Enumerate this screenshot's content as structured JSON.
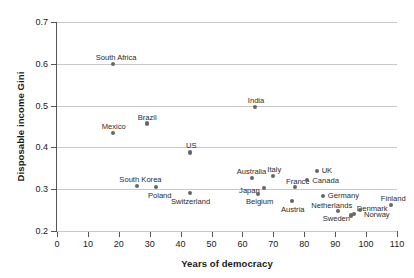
{
  "chart_data": {
    "type": "scatter",
    "title": "",
    "xlabel": "Years of democracy",
    "ylabel": "Disposable income Gini",
    "xlim": [
      0,
      110
    ],
    "ylim": [
      0.2,
      0.7
    ],
    "xticks": [
      0,
      10,
      20,
      30,
      40,
      50,
      60,
      70,
      80,
      90,
      100,
      110
    ],
    "yticks": [
      "0.2",
      "0.3",
      "0.4",
      "0.5",
      "0.6",
      "0.7"
    ],
    "grid": "horizontal",
    "legend": "none",
    "marker_color": "#666666",
    "gridline_color": "#c8c8c8",
    "axis_color": "#555555",
    "points": [
      {
        "label": "South Africa",
        "x": 18,
        "y": 0.6,
        "lx": -17,
        "ly": -11
      },
      {
        "label": "Mexico",
        "x": 18,
        "y": 0.435,
        "lx": -11,
        "ly": -11
      },
      {
        "label": "Brazil",
        "x": 29,
        "y": 0.457,
        "lx": -9,
        "ly": -11
      },
      {
        "label": "US",
        "x": 43,
        "y": 0.388,
        "lx": -4,
        "ly": -11
      },
      {
        "label": "South Korea",
        "x": 26,
        "y": 0.308,
        "lx": -18,
        "ly": -11
      },
      {
        "label": "Poland",
        "x": 32,
        "y": 0.305,
        "lx": -8,
        "ly": 4
      },
      {
        "label": "Switzerland",
        "x": 43,
        "y": 0.29,
        "lx": -19,
        "ly": 4
      },
      {
        "label": "India",
        "x": 64,
        "y": 0.497,
        "lx": -7,
        "ly": -11
      },
      {
        "label": "Australia",
        "x": 63,
        "y": 0.327,
        "lx": -15,
        "ly": -11
      },
      {
        "label": "Italy",
        "x": 70,
        "y": 0.332,
        "lx": -6,
        "ly": -11
      },
      {
        "label": "France",
        "x": 77,
        "y": 0.305,
        "lx": -9,
        "ly": -10
      },
      {
        "label": "Japan",
        "x": 67,
        "y": 0.303,
        "lx": -25,
        "ly": -2
      },
      {
        "label": "Belgium",
        "x": 65,
        "y": 0.288,
        "lx": -12,
        "ly": 3
      },
      {
        "label": "Austria",
        "x": 76,
        "y": 0.272,
        "lx": -11,
        "ly": 4
      },
      {
        "label": "Germany",
        "x": 86,
        "y": 0.283,
        "lx": 5,
        "ly": -5
      },
      {
        "label": "UK",
        "x": 84,
        "y": 0.344,
        "lx": 5,
        "ly": -5
      },
      {
        "label": "Canada",
        "x": 81,
        "y": 0.322,
        "lx": 5,
        "ly": -4
      },
      {
        "label": "Netherlands",
        "x": 91,
        "y": 0.248,
        "lx": -27,
        "ly": -10
      },
      {
        "label": "Sweden",
        "x": 95,
        "y": 0.237,
        "lx": -28,
        "ly": -2
      },
      {
        "label": "Denmark",
        "x": 96,
        "y": 0.24,
        "lx": 3,
        "ly": -10
      },
      {
        "label": "Norway",
        "x": 98,
        "y": 0.25,
        "lx": 4,
        "ly": 0
      },
      {
        "label": "Finland",
        "x": 108,
        "y": 0.262,
        "lx": -10,
        "ly": -11
      }
    ]
  }
}
